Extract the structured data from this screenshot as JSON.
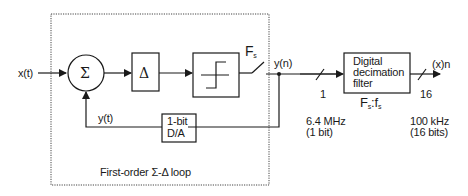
{
  "diagram": {
    "title": "First-order Σ-Δ loop",
    "input_label": "x(t)",
    "feedback_label": "y(t)",
    "output_node_label": "y(n)",
    "output_label": "(x)n",
    "summer_symbol": "Σ",
    "integrator_symbol": "Δ",
    "quantizer": "comparator",
    "sampler_label": "F",
    "sampler_sub": "s",
    "dac": {
      "line1": "1-bit",
      "line2": "D/A"
    },
    "filter": {
      "line1": "Digital",
      "line2": "decimation",
      "line3": "filter"
    },
    "filter_ratio": {
      "F": "F",
      "F_sub": "s",
      "sep": ":f",
      "f_sub": "s"
    },
    "bus_in": {
      "width": "1",
      "rate": "6.4 MHz",
      "bits": "(1 bit)"
    },
    "bus_out": {
      "width": "16",
      "rate": "100 kHz",
      "bits": "(16 bits)"
    },
    "colors": {
      "line": "#1a1a1a",
      "dotted": "#444444",
      "background": "#ffffff"
    }
  }
}
